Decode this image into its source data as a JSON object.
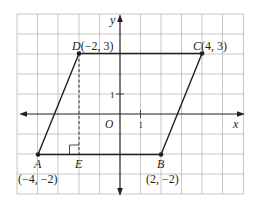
{
  "figure": {
    "type": "coordinate-plane-parallelogram",
    "axes": {
      "x_label": "x",
      "y_label": "y",
      "origin_label": "O",
      "unit_x_label": "1",
      "unit_y_label": "1"
    },
    "grid": {
      "x_min": -5,
      "x_max": 6,
      "y_min": -4,
      "y_max": 5,
      "step": 1
    },
    "points": [
      {
        "id": "A",
        "name": "A",
        "coords": "(−4, −2)",
        "x": -4,
        "y": -2
      },
      {
        "id": "B",
        "name": "B",
        "coords": "(2, −2)",
        "x": 2,
        "y": -2
      },
      {
        "id": "C",
        "name": "C",
        "coords": "(4, 3)",
        "x": 4,
        "y": 3
      },
      {
        "id": "D",
        "name": "D",
        "coords": "(−2, 3)",
        "x": -2,
        "y": 3
      },
      {
        "id": "E",
        "name": "E",
        "x": -2,
        "y": -2
      }
    ],
    "labels": {
      "D": "D(−2, 3)",
      "C": "C(4, 3)",
      "A": "A",
      "A_coords": "(−4, −2)",
      "E": "E",
      "B": "B",
      "B_coords": "(2, −2)"
    },
    "segments": [
      {
        "from": "A",
        "to": "B",
        "style": "solid"
      },
      {
        "from": "B",
        "to": "C",
        "style": "solid"
      },
      {
        "from": "C",
        "to": "D",
        "style": "solid"
      },
      {
        "from": "D",
        "to": "A",
        "style": "solid"
      },
      {
        "from": "D",
        "to": "E",
        "style": "dashed",
        "note": "altitude"
      }
    ],
    "right_angle_marker_at": "E",
    "colors": {
      "grid": "#b9b9b9",
      "ink": "#231f20",
      "background": "#ffffff"
    }
  }
}
